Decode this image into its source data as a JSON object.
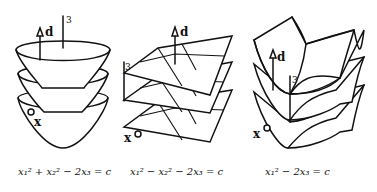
{
  "figures": [
    {
      "id": "elliptic-paraboloid",
      "direction_label": "d",
      "axis_label": "3",
      "point_label": "x",
      "caption": "x₁² + x₂² − 2x₃ = c"
    },
    {
      "id": "hyperbolic-paraboloid",
      "direction_label": "d",
      "axis_label": "3",
      "point_label": "x",
      "caption": "x₁² − x₂² − 2x₃ = c"
    },
    {
      "id": "parabolic-cylinder",
      "direction_label": "d",
      "axis_label": "3",
      "point_label": "x",
      "caption": "x₁² − 2x₃ = c"
    }
  ],
  "colors": {
    "ink": "#111111",
    "background": "#ffffff"
  }
}
